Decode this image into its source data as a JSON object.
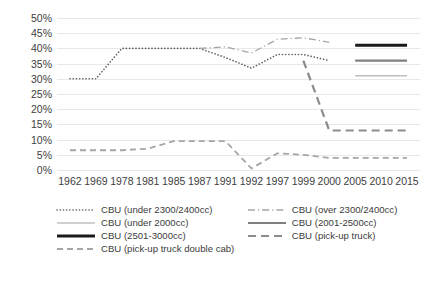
{
  "chart_data": {
    "type": "line",
    "title": "",
    "xlabel": "",
    "ylabel": "",
    "categories": [
      "1962",
      "1969",
      "1978",
      "1981",
      "1985",
      "1987",
      "1991",
      "1992",
      "1997",
      "1999",
      "2000",
      "2005",
      "2010",
      "2015"
    ],
    "ylim": [
      0,
      50
    ],
    "ytick_labels": [
      "50%",
      "45%",
      "40%",
      "35%",
      "30%",
      "25%",
      "20%",
      "15%",
      "10%",
      "5%",
      "0%"
    ],
    "ytick_values": [
      50,
      45,
      40,
      35,
      30,
      25,
      20,
      15,
      10,
      5,
      0
    ],
    "grid": true,
    "legend_position": "bottom",
    "series": [
      {
        "name": "CBU (under 2300/2400cc)",
        "style": "dotted",
        "color": "#595959",
        "values": [
          30,
          30,
          40,
          40,
          40,
          40,
          37,
          33.5,
          38,
          38,
          36,
          null,
          null,
          null
        ]
      },
      {
        "name": "CBU (over 2300/2400cc)",
        "style": "dash-dot",
        "color": "#a6a6a6",
        "values": [
          null,
          null,
          null,
          null,
          null,
          40,
          40.5,
          38.5,
          43,
          43.5,
          42,
          null,
          null,
          null
        ]
      },
      {
        "name": "CBU (under 2000cc)",
        "style": "solid-thin",
        "color": "#bfbfbf",
        "values": [
          null,
          null,
          null,
          null,
          null,
          null,
          null,
          null,
          null,
          null,
          null,
          31,
          31,
          31
        ]
      },
      {
        "name": "CBU (2001-2500cc)",
        "style": "solid-medium",
        "color": "#808080",
        "values": [
          null,
          null,
          null,
          null,
          null,
          null,
          null,
          null,
          null,
          null,
          null,
          36,
          36,
          36
        ]
      },
      {
        "name": "CBU (2501-3000cc)",
        "style": "solid-thick",
        "color": "#1a1a1a",
        "values": [
          null,
          null,
          null,
          null,
          null,
          null,
          null,
          null,
          null,
          null,
          null,
          41,
          41,
          41
        ]
      },
      {
        "name": "CBU (pick-up truck)",
        "style": "dashed-dark",
        "color": "#8c8c8c",
        "values": [
          null,
          null,
          null,
          null,
          null,
          null,
          null,
          null,
          null,
          36,
          13,
          13,
          13,
          13
        ]
      },
      {
        "name": "CBU (pick-up truck double cab)",
        "style": "dashed-light",
        "color": "#a6a6a6",
        "values": [
          6.5,
          6.5,
          6.5,
          7,
          9.5,
          9.5,
          9.5,
          0.5,
          5.5,
          5,
          4,
          4,
          4,
          4
        ]
      }
    ]
  },
  "legend": {
    "rows": [
      [
        {
          "label": "CBU (under 2300/2400cc)",
          "swatch": "dotted"
        },
        {
          "label": "CBU (over 2300/2400cc)",
          "swatch": "dash-dot"
        }
      ],
      [
        {
          "label": "CBU (under 2000cc)",
          "swatch": "solid-thin"
        },
        {
          "label": "CBU (2001-2500cc)",
          "swatch": "solid-medium"
        }
      ],
      [
        {
          "label": "CBU (2501-3000cc)",
          "swatch": "solid-thick"
        },
        {
          "label": "CBU (pick-up truck)",
          "swatch": "dashed-dark"
        }
      ],
      [
        {
          "label": "CBU (pick-up truck double cab)",
          "swatch": "dashed-light"
        }
      ]
    ]
  }
}
